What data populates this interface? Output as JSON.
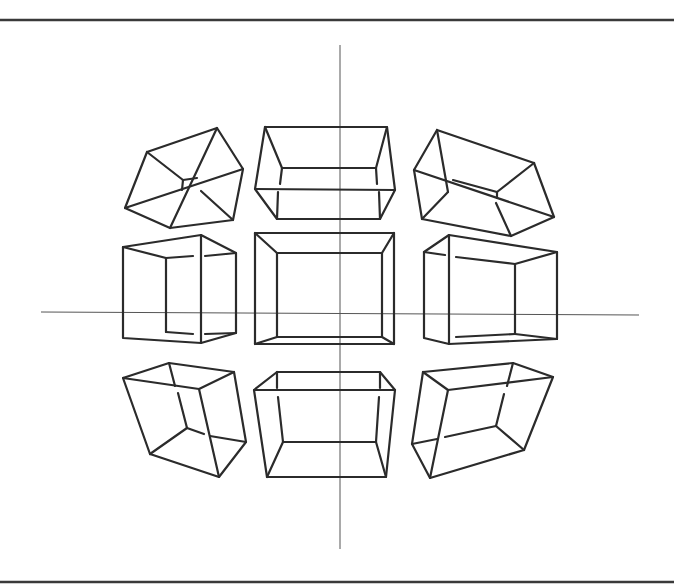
{
  "figure": {
    "width": 674,
    "height": 584,
    "background": "#ffffff",
    "line_color": "#2b2b2b",
    "borders": {
      "top": {
        "x1": 0,
        "y1": 20,
        "x2": 674,
        "y2": 20
      },
      "bottom": {
        "x1": 0,
        "y1": 582,
        "x2": 674,
        "y2": 582
      }
    },
    "axes": {
      "vertical": {
        "x1": 340,
        "y1": 45,
        "x2": 340,
        "y2": 549
      },
      "horizontal": {
        "x1": 41,
        "y1": 312,
        "x2": 639,
        "y2": 315
      }
    },
    "cubes": [
      {
        "name": "cube-top-left",
        "edges": [
          [
            [
              147,
              152
            ],
            [
              217,
              128
            ],
            [
              243,
              169
            ],
            [
              233,
              220
            ],
            [
              170,
              228
            ],
            [
              125,
              208
            ],
            [
              147,
              152
            ]
          ],
          [
            [
              125,
              208
            ],
            [
              243,
              169
            ]
          ],
          [
            [
              217,
              128
            ],
            [
              170,
              228
            ]
          ],
          [
            [
              201,
              191
            ],
            [
              233,
              220
            ]
          ],
          [
            [
              147,
              152
            ],
            [
              183,
              180
            ]
          ],
          [
            [
              183,
              180
            ],
            [
              197,
              178
            ]
          ],
          [
            [
              183,
              180
            ],
            [
              182,
              190
            ]
          ]
        ]
      },
      {
        "name": "cube-top-center",
        "edges": [
          [
            [
              265,
              127
            ],
            [
              387,
              127
            ],
            [
              395,
              190
            ],
            [
              380,
              219
            ],
            [
              277,
              219
            ],
            [
              255,
              189
            ],
            [
              265,
              127
            ]
          ],
          [
            [
              255,
              189
            ],
            [
              395,
              190
            ]
          ],
          [
            [
              265,
              127
            ],
            [
              282,
              168
            ]
          ],
          [
            [
              387,
              127
            ],
            [
              376,
              168
            ]
          ],
          [
            [
              282,
              168
            ],
            [
              376,
              168
            ]
          ],
          [
            [
              282,
              168
            ],
            [
              280,
              184
            ]
          ],
          [
            [
              376,
              168
            ],
            [
              377,
              184
            ]
          ],
          [
            [
              277,
              219
            ],
            [
              278,
              192
            ]
          ],
          [
            [
              380,
              219
            ],
            [
              379,
              192
            ]
          ]
        ]
      },
      {
        "name": "cube-top-right",
        "edges": [
          [
            [
              437,
              130
            ],
            [
              534,
              163
            ],
            [
              554,
              217
            ],
            [
              511,
              236
            ],
            [
              422,
              219
            ],
            [
              414,
              170
            ],
            [
              437,
              130
            ]
          ],
          [
            [
              437,
              130
            ],
            [
              448,
              192
            ]
          ],
          [
            [
              414,
              170
            ],
            [
              554,
              217
            ]
          ],
          [
            [
              448,
              192
            ],
            [
              422,
              219
            ]
          ],
          [
            [
              496,
              203
            ],
            [
              511,
              236
            ]
          ],
          [
            [
              534,
              163
            ],
            [
              497,
              192
            ]
          ],
          [
            [
              497,
              192
            ],
            [
              453,
              180
            ]
          ],
          [
            [
              497,
              192
            ],
            [
              497,
              198
            ]
          ]
        ]
      },
      {
        "name": "cube-middle-left",
        "edges": [
          [
            [
              123,
              247
            ],
            [
              201,
              235
            ],
            [
              236,
              253
            ],
            [
              236,
              333
            ],
            [
              201,
              343
            ],
            [
              123,
              338
            ],
            [
              123,
              247
            ]
          ],
          [
            [
              201,
              235
            ],
            [
              201,
              343
            ]
          ],
          [
            [
              123,
              247
            ],
            [
              166,
              258
            ]
          ],
          [
            [
              166,
              258
            ],
            [
              193,
              256
            ]
          ],
          [
            [
              205,
              256
            ],
            [
              236,
              253
            ]
          ],
          [
            [
              166,
              258
            ],
            [
              166,
              332
            ]
          ],
          [
            [
              166,
              332
            ],
            [
              193,
              334
            ]
          ],
          [
            [
              205,
              334
            ],
            [
              236,
              333
            ]
          ]
        ]
      },
      {
        "name": "cube-middle-center",
        "edges": [
          [
            [
              255,
              233
            ],
            [
              394,
              233
            ],
            [
              394,
              344
            ],
            [
              255,
              344
            ],
            [
              255,
              233
            ]
          ],
          [
            [
              277,
              253
            ],
            [
              382,
              253
            ],
            [
              382,
              337
            ],
            [
              277,
              337
            ],
            [
              277,
              253
            ]
          ],
          [
            [
              255,
              233
            ],
            [
              277,
              253
            ]
          ],
          [
            [
              394,
              233
            ],
            [
              382,
              253
            ]
          ],
          [
            [
              255,
              344
            ],
            [
              277,
              337
            ]
          ],
          [
            [
              394,
              344
            ],
            [
              382,
              337
            ]
          ]
        ]
      },
      {
        "name": "cube-middle-right",
        "edges": [
          [
            [
              424,
              252
            ],
            [
              449,
              235
            ],
            [
              557,
              252
            ],
            [
              557,
              339
            ],
            [
              449,
              344
            ],
            [
              424,
              338
            ],
            [
              424,
              252
            ]
          ],
          [
            [
              449,
              235
            ],
            [
              449,
              344
            ]
          ],
          [
            [
              424,
              252
            ],
            [
              445,
              255
            ]
          ],
          [
            [
              456,
              257
            ],
            [
              515,
              264
            ]
          ],
          [
            [
              515,
              264
            ],
            [
              557,
              252
            ]
          ],
          [
            [
              515,
              264
            ],
            [
              515,
              334
            ]
          ],
          [
            [
              456,
              337
            ],
            [
              515,
              334
            ]
          ],
          [
            [
              515,
              334
            ],
            [
              557,
              339
            ]
          ]
        ]
      },
      {
        "name": "cube-bottom-left",
        "edges": [
          [
            [
              123,
              378
            ],
            [
              169,
              363
            ],
            [
              234,
              372
            ],
            [
              246,
              442
            ],
            [
              219,
              477
            ],
            [
              150,
              454
            ],
            [
              123,
              378
            ]
          ],
          [
            [
              123,
              378
            ],
            [
              199,
              389
            ]
          ],
          [
            [
              199,
              389
            ],
            [
              234,
              372
            ]
          ],
          [
            [
              199,
              389
            ],
            [
              219,
              477
            ]
          ],
          [
            [
              169,
              363
            ],
            [
              175,
              386
            ]
          ],
          [
            [
              178,
              393
            ],
            [
              187,
              428
            ]
          ],
          [
            [
              187,
              428
            ],
            [
              150,
              454
            ]
          ],
          [
            [
              187,
              428
            ],
            [
              204,
              434
            ]
          ],
          [
            [
              210,
              436
            ],
            [
              246,
              442
            ]
          ]
        ]
      },
      {
        "name": "cube-bottom-center",
        "edges": [
          [
            [
              277,
              372
            ],
            [
              380,
              372
            ],
            [
              395,
              390
            ],
            [
              386,
              477
            ],
            [
              267,
              477
            ],
            [
              254,
              390
            ],
            [
              277,
              372
            ]
          ],
          [
            [
              254,
              390
            ],
            [
              395,
              390
            ]
          ],
          [
            [
              277,
              372
            ],
            [
              277,
              388
            ]
          ],
          [
            [
              380,
              372
            ],
            [
              380,
              388
            ]
          ],
          [
            [
              278,
              397
            ],
            [
              283,
              442
            ]
          ],
          [
            [
              379,
              397
            ],
            [
              376,
              442
            ]
          ],
          [
            [
              283,
              442
            ],
            [
              376,
              442
            ]
          ],
          [
            [
              283,
              442
            ],
            [
              267,
              477
            ]
          ],
          [
            [
              376,
              442
            ],
            [
              386,
              477
            ]
          ]
        ]
      },
      {
        "name": "cube-bottom-right",
        "edges": [
          [
            [
              423,
              372
            ],
            [
              513,
              363
            ],
            [
              553,
              377
            ],
            [
              524,
              450
            ],
            [
              430,
              478
            ],
            [
              412,
              444
            ],
            [
              423,
              372
            ]
          ],
          [
            [
              423,
              372
            ],
            [
              448,
              390
            ]
          ],
          [
            [
              448,
              390
            ],
            [
              553,
              377
            ]
          ],
          [
            [
              448,
              390
            ],
            [
              430,
              478
            ]
          ],
          [
            [
              513,
              363
            ],
            [
              507,
              386
            ]
          ],
          [
            [
              504,
              394
            ],
            [
              496,
              426
            ]
          ],
          [
            [
              496,
              426
            ],
            [
              524,
              450
            ]
          ],
          [
            [
              496,
              426
            ],
            [
              445,
              437
            ]
          ],
          [
            [
              437,
              439
            ],
            [
              412,
              444
            ]
          ]
        ]
      }
    ]
  }
}
